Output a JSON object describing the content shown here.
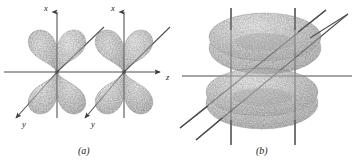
{
  "figure": {
    "type": "orbital-diagram",
    "background_color": "#ffffff",
    "ink_color": "#3a3a3a",
    "lobe_fill": "#9a9a9a",
    "lobe_edge": "#4a4a4a",
    "panels": [
      {
        "id": "a",
        "label": "(a)",
        "label_x": 82,
        "label_y": 152,
        "shape": "four-lobed-cloverleaf",
        "count": 2,
        "axes": [
          {
            "name": "x",
            "label": "x",
            "direction": "up",
            "arrow": true,
            "label_x": 44,
            "label_y": 10
          },
          {
            "name": "z",
            "label": "z",
            "direction": "right",
            "arrow": true,
            "label_x": 167,
            "label_y": 80
          },
          {
            "name": "y",
            "label": "y",
            "direction": "down-left",
            "arrow": true,
            "label_x": 32,
            "label_y": 125
          },
          {
            "name": "x2",
            "label": "x",
            "direction": "up",
            "arrow": true,
            "label_x": 111,
            "label_y": 10
          },
          {
            "name": "y2",
            "label": "y",
            "direction": "down-left",
            "arrow": true,
            "label_x": 101,
            "label_y": 125
          }
        ],
        "orbitals": [
          {
            "center_x": 57,
            "center_y": 72,
            "lobes": 4
          },
          {
            "center_x": 124,
            "center_y": 72,
            "lobes": 4
          }
        ]
      },
      {
        "id": "b",
        "label": "(b)",
        "label_x": 260,
        "label_y": 152,
        "shape": "stacked-tori",
        "count": 2,
        "axes": [
          {
            "name": "vertical-left",
            "direction": "up"
          },
          {
            "name": "vertical-right",
            "direction": "up"
          },
          {
            "name": "horizontal",
            "direction": "right"
          },
          {
            "name": "diagonal-upper-right",
            "direction": "up-right"
          },
          {
            "name": "diagonal-lower-left",
            "direction": "down-left"
          }
        ],
        "tori": [
          {
            "center_x": 265,
            "center_y": 47
          },
          {
            "center_x": 262,
            "center_y": 100
          }
        ]
      }
    ]
  },
  "caption_fragment": {
    "text": "",
    "visible": false
  }
}
